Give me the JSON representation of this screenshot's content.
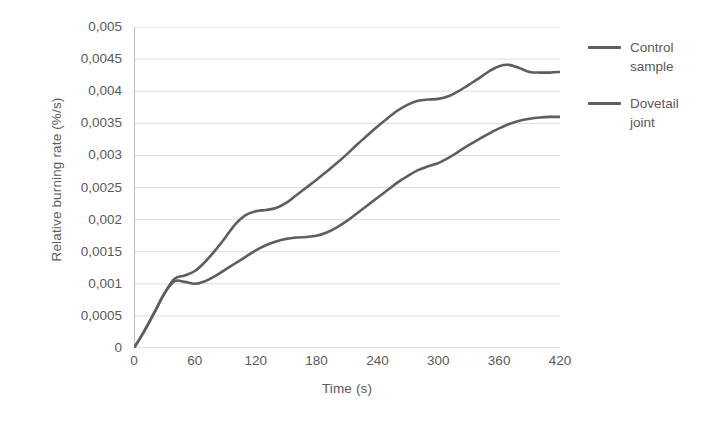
{
  "chart_data": {
    "type": "line",
    "title": "",
    "xlabel": "Time (s)",
    "ylabel": "Relative burning rate (%/s)",
    "xlim": [
      0,
      420
    ],
    "ylim": [
      0,
      0.005
    ],
    "grid": "horizontal",
    "legend_position": "right",
    "decimal_separator": ",",
    "x_ticks": [
      0,
      60,
      120,
      180,
      240,
      300,
      360,
      420
    ],
    "x_tick_labels": [
      "0",
      "60",
      "120",
      "180",
      "240",
      "300",
      "360",
      "420"
    ],
    "y_ticks": [
      0,
      0.0005,
      0.001,
      0.0015,
      0.002,
      0.0025,
      0.003,
      0.0035,
      0.004,
      0.0045,
      0.005
    ],
    "y_tick_labels": [
      "0",
      "0,0005",
      "0,001",
      "0,0015",
      "0,002",
      "0,0025",
      "0,003",
      "0,0035",
      "0,004",
      "0,0045",
      "0,005"
    ],
    "x": [
      0,
      10,
      20,
      30,
      40,
      50,
      60,
      70,
      80,
      90,
      100,
      110,
      120,
      130,
      140,
      150,
      160,
      170,
      180,
      190,
      200,
      210,
      220,
      230,
      240,
      250,
      260,
      270,
      280,
      290,
      300,
      310,
      320,
      330,
      340,
      350,
      360,
      370,
      380,
      390,
      400,
      410,
      420
    ],
    "series": [
      {
        "name": "Control sample",
        "color": "#5e5e5e",
        "values": [
          0,
          0.00026,
          0.00055,
          0.00085,
          0.00108,
          0.00113,
          0.0012,
          0.00134,
          0.00152,
          0.00172,
          0.00193,
          0.00207,
          0.00213,
          0.00215,
          0.00218,
          0.00226,
          0.00238,
          0.0025,
          0.00262,
          0.00275,
          0.00288,
          0.00302,
          0.00317,
          0.00331,
          0.00345,
          0.00358,
          0.0037,
          0.00379,
          0.00385,
          0.00387,
          0.00388,
          0.00392,
          0.004,
          0.0041,
          0.0042,
          0.00431,
          0.00439,
          0.00441,
          0.00436,
          0.0043,
          0.00429,
          0.00429,
          0.0043
        ]
      },
      {
        "name": "Dovetail joint",
        "color": "#5e5e5e",
        "values": [
          0,
          0.00026,
          0.00055,
          0.00085,
          0.00104,
          0.00103,
          0.001,
          0.00104,
          0.00112,
          0.00122,
          0.00132,
          0.00142,
          0.00152,
          0.0016,
          0.00166,
          0.0017,
          0.00172,
          0.00173,
          0.00175,
          0.0018,
          0.00188,
          0.00198,
          0.0021,
          0.00222,
          0.00234,
          0.00246,
          0.00258,
          0.00268,
          0.00277,
          0.00283,
          0.00288,
          0.00296,
          0.00306,
          0.00316,
          0.00325,
          0.00334,
          0.00342,
          0.00349,
          0.00354,
          0.00357,
          0.00359,
          0.0036,
          0.0036
        ]
      }
    ]
  },
  "legend": {
    "entries": [
      {
        "label": "Control sample"
      },
      {
        "label": "Dovetail joint"
      }
    ]
  },
  "axes": {
    "x_title": "Time (s)",
    "y_title": "Relative burning rate (%/s)"
  },
  "colors": {
    "line": "#5e5e5e",
    "grid": "#d9d9d9",
    "axis": "#bfbfbf",
    "text": "#5a5a5a"
  }
}
